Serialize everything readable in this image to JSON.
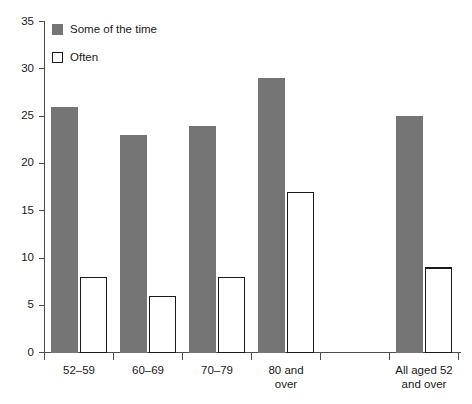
{
  "chart_data": {
    "type": "bar",
    "title": "",
    "subtitle": "",
    "xlabel": "",
    "ylabel": "",
    "ylim": [
      0,
      35
    ],
    "ytick_step": 5,
    "yticks": [
      "0",
      "5",
      "10",
      "15",
      "20",
      "25",
      "30",
      "35"
    ],
    "grid": false,
    "legend_position": "top-left",
    "categories": [
      "52–59",
      "60–69",
      "70–79",
      "80 and over",
      "",
      "All aged 52 and over"
    ],
    "category_lines": [
      [
        "52–59"
      ],
      [
        "60–69"
      ],
      [
        "70–79"
      ],
      [
        "80 and",
        "over"
      ],
      [],
      [
        "All aged 52",
        "and over"
      ]
    ],
    "series": [
      {
        "name": "Some of the time",
        "color": "#757575",
        "style": "filled",
        "values": [
          26,
          23,
          24,
          29,
          null,
          25
        ]
      },
      {
        "name": "Often",
        "color": "#ffffff",
        "style": "outlined",
        "values": [
          8,
          6,
          8,
          17,
          null,
          9
        ]
      }
    ]
  },
  "legend": {
    "items": [
      {
        "label": "Some of the time",
        "swatch": "filled-gray"
      },
      {
        "label": "Often",
        "swatch": "outlined-white"
      }
    ]
  },
  "axis": {
    "y_tick_labels": [
      "35",
      "30",
      "25",
      "20",
      "15",
      "10",
      "5",
      "0"
    ]
  }
}
